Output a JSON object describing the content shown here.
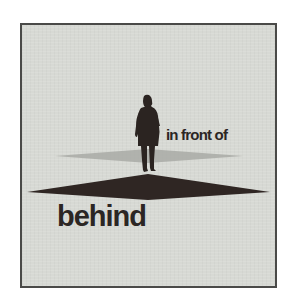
{
  "diagram": {
    "labels": {
      "front": "in front of",
      "behind": "behind"
    },
    "elements": {
      "figure": "standing-person-silhouette",
      "near_plane": "light-gray-diamond-shadow",
      "far_plane": "dark-brown-diamond-plane"
    },
    "colors": {
      "background": "#d7d9d4",
      "frame_border": "#4a4a48",
      "silhouette": "#2b2421",
      "dark_plane": "#2f2623",
      "light_plane": "#a9aaa6",
      "text": "#2b2624"
    }
  }
}
